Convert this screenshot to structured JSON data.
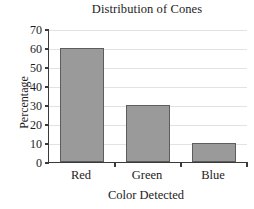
{
  "chart_data": {
    "type": "bar",
    "title": "Distribution of Cones",
    "xlabel": "Color Detected",
    "ylabel": "Percentage",
    "categories": [
      "Red",
      "Green",
      "Blue"
    ],
    "values": [
      60,
      30,
      10
    ],
    "ylim": [
      0,
      70
    ],
    "yticks": [
      0,
      10,
      20,
      30,
      40,
      50,
      60,
      70
    ],
    "ytick_labels": [
      "0",
      "10",
      "20",
      "30",
      "40",
      "50",
      "60",
      "70"
    ],
    "grid": true,
    "legend": null,
    "colors": {
      "bar_fill": "#9a9a9a",
      "bar_border": "#5d5d5d",
      "gridline": "#e2e2e2",
      "axis": "#3a3a3a",
      "text": "#1c1c1c",
      "background": "#ffffff"
    }
  }
}
